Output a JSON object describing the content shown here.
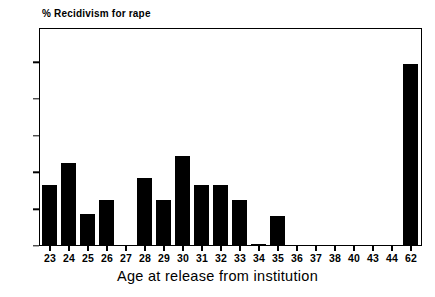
{
  "chart_data": {
    "type": "bar",
    "title": "% Recidivism for rape",
    "xlabel": "Age at release from institution",
    "ylabel": "",
    "categories": [
      "23",
      "24",
      "25",
      "26",
      "27",
      "28",
      "29",
      "30",
      "31",
      "32",
      "33",
      "34",
      "35",
      "36",
      "37",
      "38",
      "40",
      "43",
      "44",
      "62"
    ],
    "values": [
      33,
      45,
      17,
      25,
      0,
      37,
      25,
      49,
      33,
      33,
      25,
      0.5,
      16,
      0,
      0,
      0,
      0,
      0,
      0,
      99
    ],
    "ylim": [
      0,
      118
    ],
    "y_ticks": [
      0,
      20,
      40,
      60,
      80,
      100
    ],
    "y_tick_labels": [
      "0",
      "20",
      "40",
      "60",
      "80",
      "100"
    ],
    "grid": false,
    "legend": false,
    "bar_color": "#000000",
    "frame_color": "#000000",
    "background_color": "#ffffff"
  }
}
